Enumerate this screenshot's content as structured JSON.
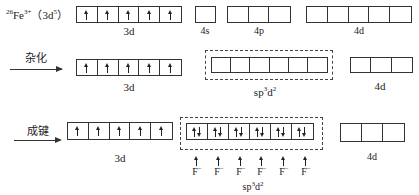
{
  "ion": {
    "z": "26",
    "symbol": "Fe",
    "charge": "3+",
    "config_open": "（3d",
    "config_exp": "5",
    "config_close": "）"
  },
  "row1": {
    "orbitals": [
      {
        "name": "3d",
        "cells": [
          "up",
          "up",
          "up",
          "up",
          "up"
        ]
      },
      {
        "name": "4s",
        "cells": [
          ""
        ]
      },
      {
        "name": "4p",
        "cells": [
          "",
          "",
          ""
        ]
      },
      {
        "name": "4d",
        "cells": [
          "",
          "",
          "",
          "",
          ""
        ]
      }
    ]
  },
  "row2": {
    "step_label": "杂化",
    "orbitals": [
      {
        "name": "3d",
        "cells": [
          "up",
          "up",
          "up",
          "up",
          "up"
        ]
      },
      {
        "name": "sp3d2",
        "label_base": "sp",
        "label_sup1": "3",
        "label_mid": "d",
        "label_sup2": "2",
        "cells": [
          "",
          "",
          "",
          "",
          "",
          ""
        ]
      },
      {
        "name": "4d",
        "cells": [
          "",
          "",
          ""
        ]
      }
    ]
  },
  "row3": {
    "step_label": "成键",
    "orbitals": [
      {
        "name": "3d",
        "cells": [
          "up",
          "up",
          "up",
          "up",
          "up"
        ]
      },
      {
        "name": "sp3d2",
        "label_base": "sp",
        "label_sup1": "3",
        "label_mid": "d",
        "label_sup2": "2",
        "cells": [
          "pair",
          "pair",
          "pair",
          "pair",
          "pair",
          "pair"
        ]
      },
      {
        "name": "4d",
        "cells": [
          "",
          "",
          ""
        ]
      }
    ],
    "ligand": "F",
    "ligand_charge": "−",
    "ligand_count": 6
  },
  "labels": {
    "3d": "3d",
    "4s": "4s",
    "4p": "4p",
    "4d": "4d"
  }
}
